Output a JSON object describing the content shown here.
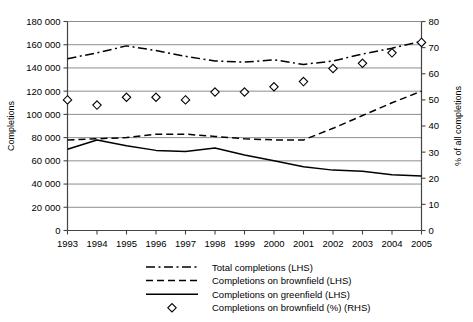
{
  "chart_data": {
    "type": "line",
    "title": "",
    "xlabel": "",
    "ylabel": "Completions",
    "y2label": "% of all completions",
    "x": [
      1993,
      1994,
      1995,
      1996,
      1997,
      1998,
      1999,
      2000,
      2001,
      2002,
      2003,
      2004,
      2005
    ],
    "categories": [
      "1993",
      "1994",
      "1995",
      "1996",
      "1997",
      "1998",
      "1999",
      "2000",
      "2001",
      "2002",
      "2003",
      "2004",
      "2005"
    ],
    "ylim": [
      0,
      180000
    ],
    "ytick_values": [
      0,
      20000,
      40000,
      60000,
      80000,
      100000,
      120000,
      140000,
      160000,
      180000
    ],
    "ytick_labels": [
      "0",
      "20 000",
      "40 000",
      "60 000",
      "80 000",
      "100 000",
      "120 000",
      "140 000",
      "160 000",
      "180 000"
    ],
    "y2lim": [
      0,
      80
    ],
    "y2tick_values": [
      0,
      10,
      20,
      30,
      40,
      50,
      60,
      70,
      80
    ],
    "y2tick_labels": [
      "0",
      "10",
      "20",
      "30",
      "40",
      "50",
      "60",
      "70",
      "80"
    ],
    "grid": true,
    "legend_position": "bottom",
    "series": [
      {
        "name": "Total completions (LHS)",
        "axis": "left",
        "style": "dashdot",
        "marker": "none",
        "values": [
          148000,
          153000,
          159000,
          155000,
          150000,
          146000,
          145000,
          147000,
          143000,
          146000,
          152000,
          157000,
          163000
        ]
      },
      {
        "name": "Completions on brownfield (LHS)",
        "axis": "left",
        "style": "dashed",
        "marker": "none",
        "values": [
          78000,
          79000,
          80000,
          83000,
          83000,
          81000,
          79000,
          78000,
          78000,
          88000,
          99000,
          110000,
          120000
        ]
      },
      {
        "name": "Completions on greenfield (LHS)",
        "axis": "left",
        "style": "solid",
        "marker": "none",
        "values": [
          70000,
          78000,
          73000,
          69000,
          68000,
          71000,
          65000,
          60000,
          55000,
          52000,
          51000,
          48000,
          47000
        ]
      },
      {
        "name": "Completions on brownfield (%) (RHS)",
        "axis": "right",
        "style": "none",
        "marker": "diamond",
        "values": [
          50,
          48,
          51,
          51,
          50,
          53,
          53,
          55,
          57,
          62,
          64,
          68,
          72
        ]
      }
    ]
  },
  "legend": {
    "items": [
      {
        "label": "Total completions (LHS)",
        "style": "dashdot"
      },
      {
        "label": "Completions on brownfield (LHS)",
        "style": "dashed"
      },
      {
        "label": "Completions on greenfield (LHS)",
        "style": "solid"
      },
      {
        "label": "Completions on brownfield (%) (RHS)",
        "style": "diamond"
      }
    ]
  },
  "colors": {
    "line": "#000000",
    "grid": "#808080",
    "axis": "#555555",
    "background": "#ffffff"
  }
}
